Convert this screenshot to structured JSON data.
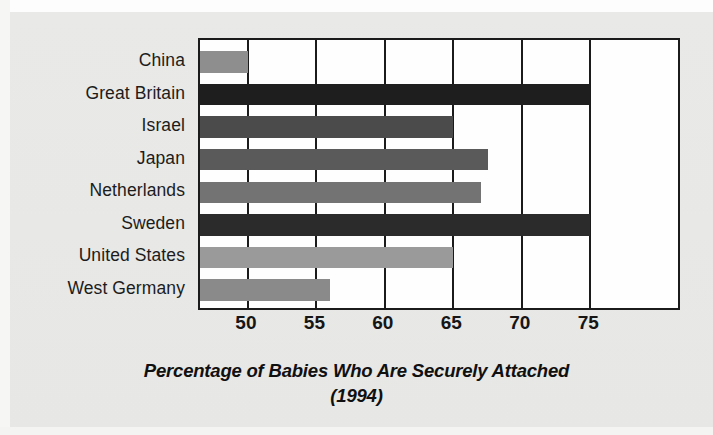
{
  "chart_data": {
    "type": "bar",
    "orientation": "horizontal",
    "title": "Percentage of Babies Who Are Securely Attached",
    "subtitle": "(1994)",
    "title_line1": "Percentage of Babies Who Are Securely Attached",
    "title_line2": "(1994)",
    "xlabel": "",
    "ylabel": "",
    "xlim": [
      46.5,
      81.7
    ],
    "xticks": [
      50,
      55,
      60,
      65,
      70,
      75
    ],
    "xtick_labels": [
      "50",
      "55",
      "60",
      "65",
      "70",
      "75"
    ],
    "grid": "vertical",
    "legend": "none",
    "categories": [
      "China",
      "Great Britain",
      "Israel",
      "Japan",
      "Netherlands",
      "Sweden",
      "United States",
      "West Germany"
    ],
    "values": [
      50,
      75,
      65,
      67.5,
      67,
      75,
      65,
      56
    ],
    "bar_colors": [
      "#8e8e8e",
      "#1e1e1e",
      "#4b4b4b",
      "#5a5a5a",
      "#737373",
      "#2b2b2b",
      "#9a9a9a",
      "#8a8a8a"
    ],
    "points": [
      {
        "category": "China",
        "value": 50,
        "color": "#8e8e8e"
      },
      {
        "category": "Great Britain",
        "value": 75,
        "color": "#1e1e1e"
      },
      {
        "category": "Israel",
        "value": 65,
        "color": "#4b4b4b"
      },
      {
        "category": "Japan",
        "value": 67.5,
        "color": "#5a5a5a"
      },
      {
        "category": "Netherlands",
        "value": 67,
        "color": "#737373"
      },
      {
        "category": "Sweden",
        "value": 75,
        "color": "#2b2b2b"
      },
      {
        "category": "United States",
        "value": 65,
        "color": "#9a9a9a"
      },
      {
        "category": "West Germany",
        "value": 56,
        "color": "#8a8a8a"
      }
    ]
  },
  "style": {
    "background": "#e8e8e6",
    "plot_background": "#fefefe",
    "axis_color": "#1b1b1b",
    "text_color": "#1c1c1c"
  }
}
